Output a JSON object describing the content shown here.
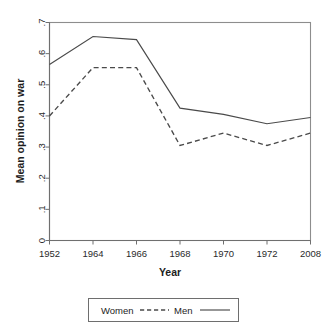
{
  "chart_data": {
    "type": "line",
    "title": "",
    "xlabel": "Year",
    "ylabel": "Mean opinion on war",
    "categories": [
      "1952",
      "1964",
      "1966",
      "1968",
      "1970",
      "1972",
      "2008"
    ],
    "x_tick_labels": [
      "1952",
      "1964",
      "1966",
      "1968",
      "1970",
      "1972",
      "2008"
    ],
    "y_tick_labels": [
      "0",
      ".1",
      ".2",
      ".3",
      ".4",
      ".5",
      ".6",
      ".7"
    ],
    "y_tick_values": [
      0,
      0.1,
      0.2,
      0.3,
      0.4,
      0.5,
      0.6,
      0.7
    ],
    "ylim": [
      0,
      0.7
    ],
    "grid": false,
    "legend_position": "bottom-center",
    "series": [
      {
        "name": "Women",
        "style": "dashed",
        "color": "#4a4a4a",
        "values": [
          0.4,
          0.555,
          0.555,
          0.305,
          0.345,
          0.305,
          0.345
        ]
      },
      {
        "name": "Men",
        "style": "solid",
        "color": "#4a4a4a",
        "values": [
          0.565,
          0.655,
          0.645,
          0.425,
          0.405,
          0.375,
          0.395
        ]
      }
    ],
    "legend_entries": [
      {
        "label": "Women",
        "style": "dashed"
      },
      {
        "label": "Men",
        "style": "solid"
      }
    ]
  },
  "legend": {
    "women_label": "Women",
    "men_label": "Men"
  },
  "axes": {
    "x_title": "Year",
    "y_title": "Mean opinion on war"
  }
}
